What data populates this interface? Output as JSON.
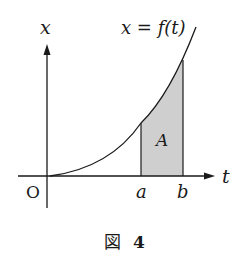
{
  "diagram": {
    "y_axis_label": "x",
    "x_axis_label": "t",
    "origin_label": "O",
    "curve_label": "x = f(t)",
    "area_label": "A",
    "point_a_label": "a",
    "point_b_label": "b",
    "caption_prefix": "図",
    "caption_number": "4",
    "colors": {
      "ink": "#1a1a1a",
      "shade": "#cfcfcf"
    }
  }
}
